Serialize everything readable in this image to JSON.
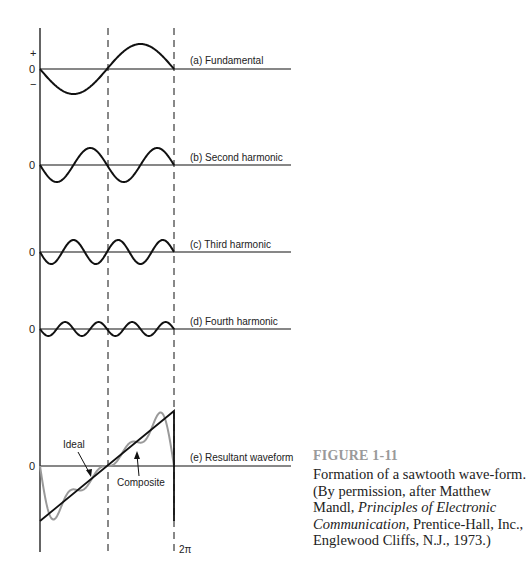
{
  "figure": {
    "number": "FIGURE 1-11",
    "caption_parts": [
      {
        "text": "Formation of a sawtooth wave-form. (By permission, after Matthew Mandl, ",
        "italic": false
      },
      {
        "text": "Principles of Electronic Communication,",
        "italic": true
      },
      {
        "text": " Prentice-Hall, Inc., Englewood Cliffs, N.J., 1973.)",
        "italic": false
      }
    ]
  },
  "axes": {
    "plus_label": "+",
    "minus_label": "−",
    "zero_label": "0",
    "period_label": "2π"
  },
  "panels": [
    {
      "id": "a",
      "label": "(a) Fundamental",
      "harmonic": 1
    },
    {
      "id": "b",
      "label": "(b) Second harmonic",
      "harmonic": 2
    },
    {
      "id": "c",
      "label": "(c) Third harmonic",
      "harmonic": 3
    },
    {
      "id": "d",
      "label": "(d) Fourth harmonic",
      "harmonic": 4
    },
    {
      "id": "e",
      "label": "(e) Resultant waveform",
      "harmonic": null
    }
  ],
  "annotations": {
    "ideal": "Ideal",
    "composite": "Composite"
  },
  "colors": {
    "ink": "#111111",
    "composite": "#9a9a9a",
    "caption_title": "#9a9a9a"
  },
  "chart_data": {
    "type": "line",
    "xlabel": "",
    "ylabel": "",
    "x_range": [
      0,
      "2π"
    ],
    "series": [
      {
        "name": "(a) Fundamental",
        "formula": "-sin(x)",
        "relative_amplitude": 1.0
      },
      {
        "name": "(b) Second harmonic",
        "formula": "-sin(2x)/2",
        "relative_amplitude": 0.5
      },
      {
        "name": "(c) Third harmonic",
        "formula": "-sin(3x)/3",
        "relative_amplitude": 0.33
      },
      {
        "name": "(d) Fourth harmonic",
        "formula": "-sin(4x)/4",
        "relative_amplitude": 0.25
      },
      {
        "name": "Composite",
        "formula": "sum of (a)-(d)"
      },
      {
        "name": "Ideal",
        "formula": "linear ramp from negative peak at 0 to positive peak at 2π, then vertical drop"
      }
    ],
    "tick_labels": [
      "+",
      "0",
      "−",
      "2π"
    ],
    "grid": false
  }
}
